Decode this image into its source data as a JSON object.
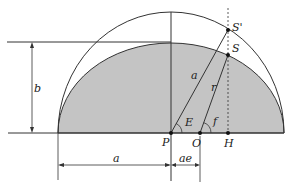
{
  "diagram": {
    "labels": {
      "S_prime": "S'",
      "S": "S",
      "a_radius": "a",
      "r": "r",
      "b": "b",
      "E": "E",
      "f": "f",
      "P": "P",
      "O": "O",
      "H": "H",
      "a_dim": "a",
      "ae_dim": "ae"
    },
    "colors": {
      "ellipse_fill": "#c4c4c4",
      "stroke": "#333333",
      "background": "#ffffff"
    },
    "points": {
      "P": [
        171,
        133
      ],
      "O": [
        200,
        133
      ],
      "H": [
        228,
        133
      ],
      "S_prime": [
        228,
        30
      ],
      "S": [
        228,
        55
      ]
    }
  }
}
